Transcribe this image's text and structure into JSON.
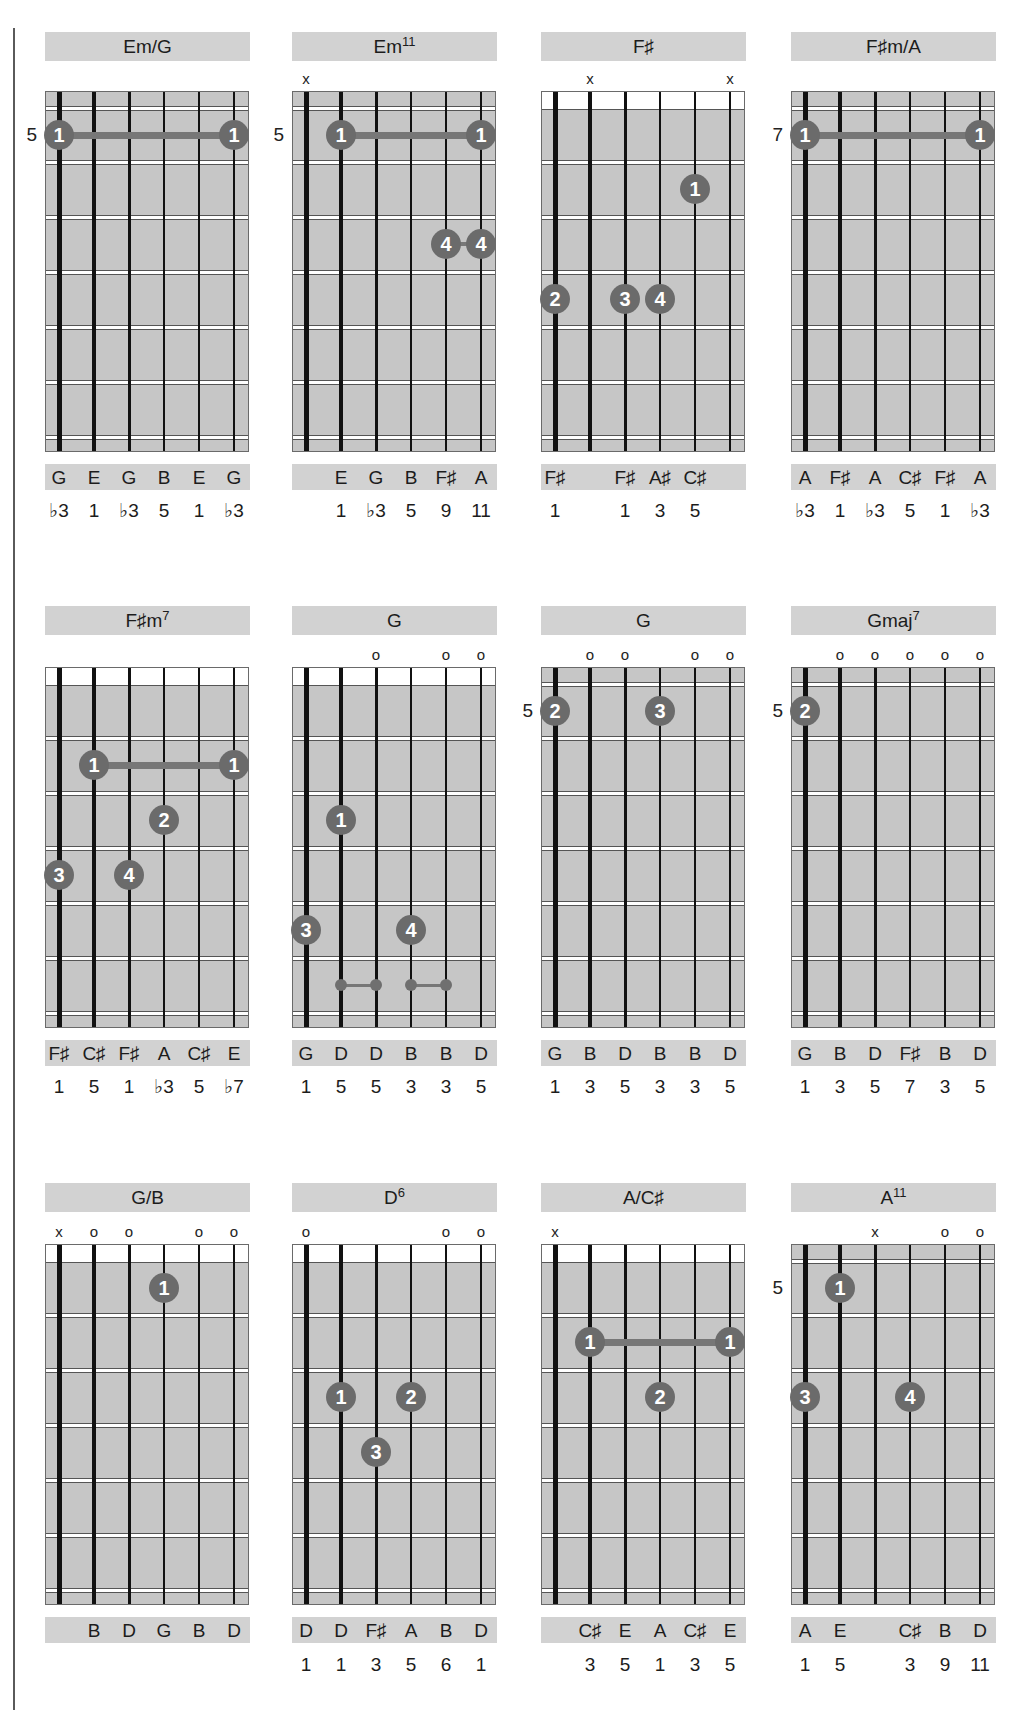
{
  "page": {
    "string_count": 6,
    "colors": {
      "fretboard": "#c6c6c6",
      "title_bar": "#d2d2d2",
      "finger_dot": "#6b6b6b",
      "barre": "#777777",
      "string": "#111111"
    }
  },
  "chords": [
    {
      "name": "Em/G",
      "sup": "",
      "nut": "gray",
      "position": "5",
      "markers": [
        "",
        "",
        "",
        "",
        "",
        ""
      ],
      "barres": [
        {
          "fret": 1,
          "from": 1,
          "to": 6,
          "finger": "1"
        }
      ],
      "dots": [],
      "ties": [],
      "notes": [
        "G",
        "E",
        "G",
        "B",
        "E",
        "G"
      ],
      "intervals": [
        "♭3",
        "1",
        "♭3",
        "5",
        "1",
        "♭3"
      ]
    },
    {
      "name": "Em",
      "sup": "11",
      "nut": "gray",
      "position": "5",
      "markers": [
        "x",
        "",
        "",
        "",
        "",
        ""
      ],
      "barres": [
        {
          "fret": 1,
          "from": 2,
          "to": 6,
          "finger": "1"
        }
      ],
      "dots": [
        {
          "string": 5,
          "fret": 3,
          "finger": "4"
        },
        {
          "string": 6,
          "fret": 3,
          "finger": "4"
        }
      ],
      "ties": [
        {
          "fret": 3,
          "from": 5,
          "to": 6
        }
      ],
      "notes": [
        "",
        "E",
        "G",
        "B",
        "F♯",
        "A"
      ],
      "intervals": [
        "",
        "1",
        "♭3",
        "5",
        "9",
        "11"
      ]
    },
    {
      "name": "F♯",
      "sup": "",
      "nut": "white",
      "position": "",
      "markers": [
        "",
        "x",
        "",
        "",
        "",
        "x"
      ],
      "barres": [],
      "dots": [
        {
          "string": 5,
          "fret": 2,
          "finger": "1"
        },
        {
          "string": 1,
          "fret": 4,
          "finger": "2"
        },
        {
          "string": 3,
          "fret": 4,
          "finger": "3"
        },
        {
          "string": 4,
          "fret": 4,
          "finger": "4"
        }
      ],
      "ties": [],
      "notes": [
        "F♯",
        "",
        "F♯",
        "A♯",
        "C♯",
        ""
      ],
      "intervals": [
        "1",
        "",
        "1",
        "3",
        "5",
        ""
      ]
    },
    {
      "name": "F♯m/A",
      "sup": "",
      "nut": "gray",
      "position": "7",
      "markers": [
        "",
        "",
        "",
        "",
        "",
        ""
      ],
      "barres": [
        {
          "fret": 1,
          "from": 1,
          "to": 6,
          "finger": "1"
        }
      ],
      "dots": [],
      "ties": [],
      "notes": [
        "A",
        "F♯",
        "A",
        "C♯",
        "F♯",
        "A"
      ],
      "intervals": [
        "♭3",
        "1",
        "♭3",
        "5",
        "1",
        "♭3"
      ]
    },
    {
      "name": "F♯m",
      "sup": "7",
      "nut": "white",
      "position": "",
      "markers": [
        "",
        "",
        "",
        "",
        "",
        ""
      ],
      "barres": [
        {
          "fret": 2,
          "from": 2,
          "to": 6,
          "finger": "1"
        }
      ],
      "dots": [
        {
          "string": 4,
          "fret": 3,
          "finger": "2"
        },
        {
          "string": 1,
          "fret": 4,
          "finger": "3"
        },
        {
          "string": 3,
          "fret": 4,
          "finger": "4"
        }
      ],
      "ties": [],
      "notes": [
        "F♯",
        "C♯",
        "F♯",
        "A",
        "C♯",
        "E"
      ],
      "intervals": [
        "1",
        "5",
        "1",
        "♭3",
        "5",
        "♭7"
      ]
    },
    {
      "name": "G",
      "sup": "",
      "nut": "white",
      "position": "",
      "markers": [
        "",
        "",
        "o",
        "",
        "o",
        "o"
      ],
      "barres": [],
      "dots": [
        {
          "string": 2,
          "fret": 3,
          "finger": "1"
        },
        {
          "string": 1,
          "fret": 5,
          "finger": "3"
        },
        {
          "string": 4,
          "fret": 5,
          "finger": "4"
        }
      ],
      "ties": [],
      "mini_pairs": [
        {
          "fret": 6,
          "from": 2,
          "to": 3
        },
        {
          "fret": 6,
          "from": 4,
          "to": 5
        }
      ],
      "notes": [
        "G",
        "D",
        "D",
        "B",
        "B",
        "D"
      ],
      "intervals": [
        "1",
        "5",
        "5",
        "3",
        "3",
        "5"
      ]
    },
    {
      "name": "G",
      "sup": "",
      "nut": "gray",
      "position": "5",
      "markers": [
        "",
        "o",
        "o",
        "",
        "o",
        "o"
      ],
      "barres": [],
      "dots": [
        {
          "string": 1,
          "fret": 1,
          "finger": "2"
        },
        {
          "string": 4,
          "fret": 1,
          "finger": "3"
        }
      ],
      "ties": [],
      "notes": [
        "G",
        "B",
        "D",
        "B",
        "B",
        "D"
      ],
      "intervals": [
        "1",
        "3",
        "5",
        "3",
        "3",
        "5"
      ]
    },
    {
      "name": "Gmaj",
      "sup": "7",
      "nut": "gray",
      "position": "5",
      "markers": [
        "",
        "o",
        "o",
        "o",
        "o",
        "o"
      ],
      "barres": [],
      "dots": [
        {
          "string": 1,
          "fret": 1,
          "finger": "2"
        }
      ],
      "ties": [],
      "notes": [
        "G",
        "B",
        "D",
        "F♯",
        "B",
        "D"
      ],
      "intervals": [
        "1",
        "3",
        "5",
        "7",
        "3",
        "5"
      ]
    },
    {
      "name": "G/B",
      "sup": "",
      "nut": "white",
      "position": "",
      "markers": [
        "x",
        "o",
        "o",
        "",
        "o",
        "o"
      ],
      "barres": [],
      "dots": [
        {
          "string": 4,
          "fret": 1,
          "finger": "1"
        }
      ],
      "ties": [],
      "notes": [
        "",
        "B",
        "D",
        "G",
        "B",
        "D"
      ],
      "intervals": [
        "",
        "",
        "",
        "",
        "",
        ""
      ]
    },
    {
      "name": "D",
      "sup": "6",
      "nut": "white",
      "position": "",
      "markers": [
        "o",
        "",
        "",
        "",
        "o",
        "o"
      ],
      "barres": [],
      "dots": [
        {
          "string": 2,
          "fret": 3,
          "finger": "1"
        },
        {
          "string": 4,
          "fret": 3,
          "finger": "2"
        },
        {
          "string": 3,
          "fret": 4,
          "finger": "3"
        }
      ],
      "ties": [],
      "notes": [
        "D",
        "D",
        "F♯",
        "A",
        "B",
        "D"
      ],
      "intervals": [
        "1",
        "1",
        "3",
        "5",
        "6",
        "1"
      ]
    },
    {
      "name": "A/C♯",
      "sup": "",
      "nut": "white",
      "position": "",
      "markers": [
        "x",
        "",
        "",
        "",
        "",
        ""
      ],
      "barres": [
        {
          "fret": 2,
          "from": 2,
          "to": 6,
          "finger": "1"
        }
      ],
      "dots": [
        {
          "string": 4,
          "fret": 3,
          "finger": "2"
        }
      ],
      "ties": [],
      "notes": [
        "",
        "C♯",
        "E",
        "A",
        "C♯",
        "E"
      ],
      "intervals": [
        "",
        "3",
        "5",
        "1",
        "3",
        "5"
      ]
    },
    {
      "name": "A",
      "sup": "11",
      "nut": "gray",
      "position": "5",
      "markers": [
        "",
        "",
        "x",
        "",
        "o",
        "o"
      ],
      "barres": [],
      "dots": [
        {
          "string": 2,
          "fret": 1,
          "finger": "1"
        },
        {
          "string": 1,
          "fret": 3,
          "finger": "3"
        },
        {
          "string": 4,
          "fret": 3,
          "finger": "4"
        }
      ],
      "ties": [],
      "notes": [
        "A",
        "E",
        "",
        "C♯",
        "B",
        "D"
      ],
      "intervals": [
        "1",
        "5",
        "",
        "3",
        "9",
        "11"
      ]
    }
  ]
}
